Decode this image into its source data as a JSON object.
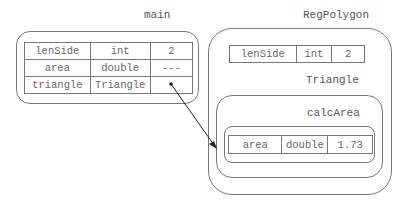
{
  "frames": {
    "main": {
      "title": "main",
      "variables": [
        {
          "name": "lenSide",
          "type": "int",
          "value": "2"
        },
        {
          "name": "area",
          "type": "double",
          "value": "---"
        },
        {
          "name": "triangle",
          "type": "Triangle",
          "value": ""
        }
      ]
    },
    "regpolygon": {
      "title": "RegPolygon",
      "variables": [
        {
          "name": "lenSide",
          "type": "int",
          "value": "2"
        }
      ],
      "triangle": {
        "title": "Triangle",
        "calcarea": {
          "title": "calcArea",
          "variables": [
            {
              "name": "area",
              "type": "double",
              "value": "1.73"
            }
          ]
        }
      }
    }
  },
  "reference_arrow": {
    "from": "main.triangle",
    "to": "Triangle"
  }
}
